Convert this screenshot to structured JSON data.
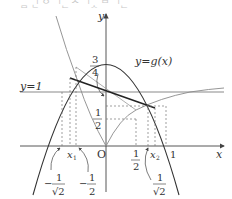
{
  "header": {
    "cut_text": "ᆷ ᅟᅵᆫ ᄋ ᅵᆫ ᄉ ᅵᆺ ᄆ ᅵᆫ"
  },
  "axes": {
    "x_label": "x",
    "y_label": "y",
    "origin_label": "O",
    "x_tick_one": "1"
  },
  "curves": {
    "parabola_label": "y=g(x)",
    "horizontal_line_label": "y=1"
  },
  "labels": {
    "x1": "x",
    "x1_sub": "1",
    "x2": "x",
    "x2_sub": "2",
    "three_quarters_num": "3",
    "three_quarters_den": "4",
    "half_y_num": "1",
    "half_y_den": "2",
    "half_x_num": "1",
    "half_x_den": "2",
    "neg_inv_sqrt2_sign": "−",
    "neg_inv_sqrt2_num": "1",
    "neg_inv_sqrt2_den": "√2",
    "neg_half_sign": "−",
    "neg_half_num": "1",
    "neg_half_den": "2",
    "inv_sqrt2_num": "1",
    "inv_sqrt2_den": "√2"
  },
  "colors": {
    "axis": "#444444",
    "parabola": "#333333",
    "gray_curve": "#8a8a8a",
    "chord": "#222222",
    "dashed": "#777777",
    "line_y1": "#8a8a8a"
  }
}
